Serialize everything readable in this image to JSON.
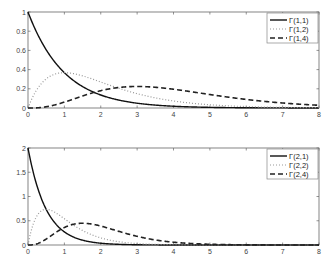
{
  "chart_data": [
    {
      "type": "line",
      "title": "",
      "xlabel": "",
      "ylabel": "",
      "xlim": [
        0,
        8
      ],
      "ylim": [
        0,
        1
      ],
      "xticks": [
        "0",
        "1",
        "2",
        "3",
        "4",
        "5",
        "6",
        "7",
        "8"
      ],
      "yticks": [
        "0",
        "0.2",
        "0.4",
        "0.6",
        "0.8",
        "1"
      ],
      "grid": false,
      "legend_position": "upper right",
      "series": [
        {
          "name": "Γ(1,1)",
          "style": "solid",
          "shape": 1,
          "scale": 1
        },
        {
          "name": "Γ(1,2)",
          "style": "dotted",
          "shape": 1,
          "scale": 2
        },
        {
          "name": "Γ(1,4)",
          "style": "dashed",
          "shape": 1,
          "scale": 4
        }
      ]
    },
    {
      "type": "line",
      "title": "",
      "xlabel": "",
      "ylabel": "",
      "xlim": [
        0,
        8
      ],
      "ylim": [
        0,
        2
      ],
      "xticks": [
        "0",
        "1",
        "2",
        "3",
        "4",
        "5",
        "6",
        "7",
        "8"
      ],
      "yticks": [
        "0",
        "0.5",
        "1",
        "1.5",
        "2"
      ],
      "grid": false,
      "legend_position": "upper right",
      "series": [
        {
          "name": "Γ(2,1)",
          "style": "solid",
          "shape": 2,
          "scale": 1
        },
        {
          "name": "Γ(2,2)",
          "style": "dotted",
          "shape": 2,
          "scale": 2
        },
        {
          "name": "Γ(2,4)",
          "style": "dashed",
          "shape": 2,
          "scale": 4
        }
      ]
    }
  ],
  "plots": [
    {
      "legend": [
        "Γ(1,1)",
        "Γ(1,2)",
        "Γ(1,4)"
      ]
    },
    {
      "legend": [
        "Γ(2,1)",
        "Γ(2,2)",
        "Γ(2,4)"
      ]
    }
  ]
}
